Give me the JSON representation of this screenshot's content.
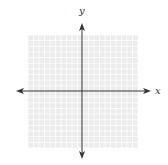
{
  "diagram": {
    "type": "coordinate-plane",
    "x_axis_label": "x",
    "y_axis_label": "y",
    "grid": {
      "cells_x": 20,
      "cells_y": 20,
      "left": 28,
      "top": 35,
      "right": 138,
      "bottom": 148
    },
    "origin": {
      "x": 82,
      "y": 91
    },
    "x_axis": {
      "from": 16,
      "to": 151
    },
    "y_axis": {
      "from": 23,
      "to": 159
    },
    "colors": {
      "grid_fill": "#ececec",
      "grid_line": "#ffffff",
      "axis": "#333333",
      "label": "#333333"
    }
  }
}
